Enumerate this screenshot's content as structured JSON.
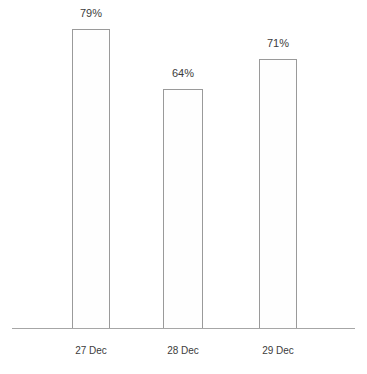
{
  "chart_data": {
    "type": "bar",
    "title": "",
    "subtitle": "",
    "xlabel": "",
    "ylabel": "",
    "categories": [
      "27 Dec",
      "28 Dec",
      "29 Dec"
    ],
    "values": [
      79,
      64,
      71
    ],
    "value_labels": [
      "79%",
      "64%",
      "71%"
    ],
    "ylim": [
      0,
      100
    ],
    "grid": false,
    "legend": false,
    "legend_position": "none",
    "series": [
      {
        "name": "",
        "values": [
          79,
          64,
          71
        ]
      }
    ],
    "colors": {
      "bar_fill": "#fefefe",
      "bar_border": "#9a9a9a",
      "axis_line": "#a6a6a6",
      "label_text": "#3c3c3c",
      "background": "#ffffff"
    }
  },
  "bars": [
    {
      "category": "27 Dec",
      "value": 79,
      "value_label": "79%",
      "left": 72,
      "width": 38,
      "top": 29,
      "height": 300,
      "label_left": 59,
      "label_top": 7,
      "label_width": 64,
      "cat_left": 53,
      "cat_width": 76
    },
    {
      "category": "28 Dec",
      "value": 64,
      "value_label": "64%",
      "left": 163,
      "width": 40,
      "top": 89,
      "height": 240,
      "label_left": 151,
      "label_top": 67,
      "label_width": 64,
      "cat_left": 145,
      "cat_width": 76
    },
    {
      "category": "29 Dec",
      "value": 71,
      "value_label": "71%",
      "left": 259,
      "width": 38,
      "top": 59,
      "height": 270,
      "label_left": 246,
      "label_top": 37,
      "label_width": 64,
      "cat_left": 240,
      "cat_width": 76
    }
  ]
}
